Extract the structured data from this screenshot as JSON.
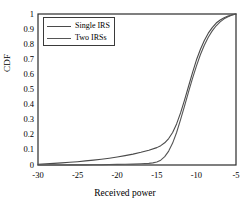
{
  "chart_data": {
    "type": "line",
    "title": "",
    "xlabel": "Received power",
    "ylabel": "CDF",
    "xlim": [
      -30,
      -5
    ],
    "ylim": [
      0,
      1
    ],
    "grid": false,
    "legend_position": "upper-left",
    "xticks": [
      "-30",
      "-25",
      "-20",
      "-15",
      "-10",
      "-5"
    ],
    "xtick_values": [
      -30,
      -25,
      -20,
      -15,
      -10,
      -5
    ],
    "yticks": [
      "0",
      "0.1",
      "0.2",
      "0.3",
      "0.4",
      "0.5",
      "0.6",
      "0.7",
      "0.8",
      "0.9",
      "1"
    ],
    "ytick_values": [
      0,
      0.1,
      0.2,
      0.3,
      0.4,
      0.5,
      0.6,
      0.7,
      0.8,
      0.9,
      1
    ],
    "colors": {
      "single_irs": "#4a4a4a",
      "two_irss": "#555555",
      "axis": "#2b2b2b",
      "background": "#ffffff"
    },
    "series": [
      {
        "name": "Single IRS",
        "x": [
          -30,
          -29,
          -28,
          -27,
          -26,
          -25,
          -24,
          -23,
          -22,
          -21,
          -20,
          -19,
          -18,
          -17,
          -16,
          -15,
          -14.5,
          -14,
          -13.5,
          -13,
          -12.5,
          -12,
          -11.5,
          -11,
          -10.5,
          -10,
          -9.5,
          -9,
          -8.5,
          -8,
          -7.5,
          -7,
          -6.5,
          -6,
          -5.5,
          -5
        ],
        "values": [
          0.005,
          0.008,
          0.011,
          0.014,
          0.018,
          0.022,
          0.027,
          0.032,
          0.038,
          0.045,
          0.053,
          0.062,
          0.072,
          0.084,
          0.098,
          0.115,
          0.128,
          0.147,
          0.175,
          0.215,
          0.272,
          0.345,
          0.43,
          0.52,
          0.61,
          0.695,
          0.765,
          0.825,
          0.873,
          0.91,
          0.94,
          0.96,
          0.975,
          0.986,
          0.994,
          1.0
        ]
      },
      {
        "name": "Two IRSs",
        "x": [
          -30,
          -29,
          -28,
          -27,
          -26,
          -25,
          -24,
          -23,
          -22,
          -21,
          -20,
          -19,
          -18,
          -17,
          -16,
          -15.5,
          -15,
          -14.5,
          -14,
          -13.5,
          -13,
          -12.5,
          -12,
          -11.5,
          -11,
          -10.5,
          -10,
          -9.5,
          -9,
          -8.5,
          -8,
          -7.5,
          -7,
          -6.5,
          -6,
          -5.5,
          -5
        ],
        "values": [
          0.0,
          0.0,
          0.0,
          0.0,
          0.001,
          0.001,
          0.001,
          0.002,
          0.002,
          0.003,
          0.004,
          0.005,
          0.006,
          0.008,
          0.011,
          0.014,
          0.02,
          0.032,
          0.055,
          0.092,
          0.145,
          0.215,
          0.3,
          0.39,
          0.482,
          0.572,
          0.655,
          0.73,
          0.793,
          0.846,
          0.888,
          0.922,
          0.948,
          0.968,
          0.982,
          0.993,
          1.0
        ]
      }
    ]
  },
  "legend": {
    "items": [
      {
        "label": "Single IRS"
      },
      {
        "label": "Two IRSs"
      }
    ]
  }
}
